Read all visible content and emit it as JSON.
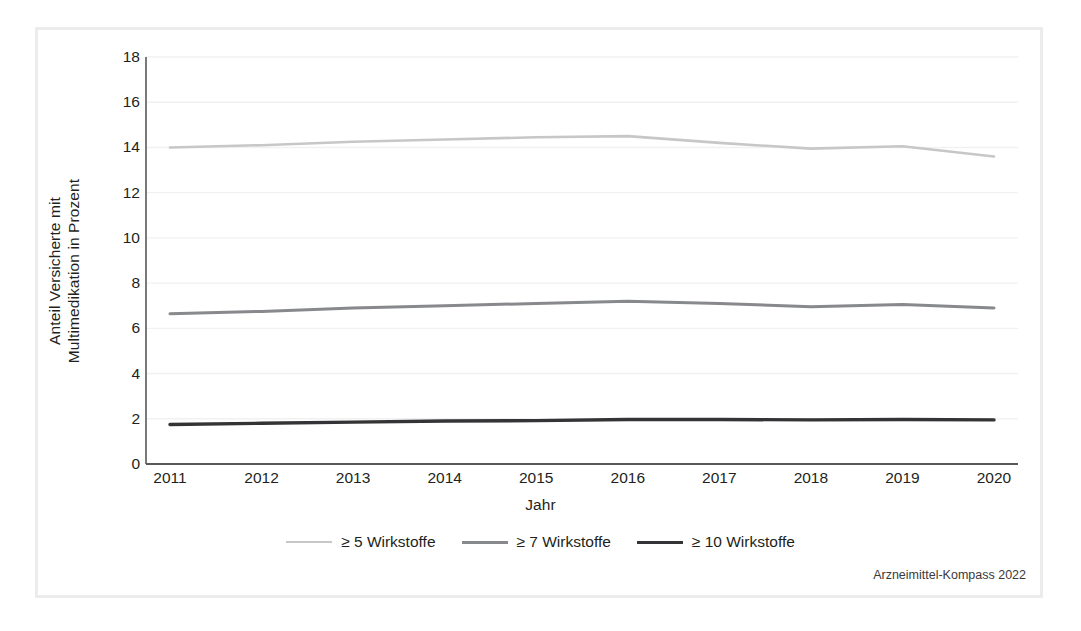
{
  "chart_data": {
    "type": "line",
    "title": "",
    "xlabel": "Jahr",
    "ylabel": "Anteil Versicherte mit Multimedikation in Prozent",
    "categories": [
      "2011",
      "2012",
      "2013",
      "2014",
      "2015",
      "2016",
      "2017",
      "2018",
      "2019",
      "2020"
    ],
    "x": [
      2011,
      2012,
      2013,
      2014,
      2015,
      2016,
      2017,
      2018,
      2019,
      2020
    ],
    "ylim": [
      0,
      18
    ],
    "yticks": [
      0,
      2,
      4,
      6,
      8,
      10,
      12,
      14,
      16,
      18
    ],
    "ytick_labels": [
      "0",
      "2",
      "4",
      "6",
      "8",
      "10",
      "12",
      "14",
      "16",
      "18"
    ],
    "grid": "horizontal",
    "legend_position": "bottom",
    "series": [
      {
        "name": "≥ 5 Wirkstoffe",
        "color": "#c7c7c9",
        "values": [
          14.0,
          14.1,
          14.25,
          14.35,
          14.45,
          14.5,
          14.2,
          13.95,
          14.05,
          13.6
        ]
      },
      {
        "name": "≥ 7 Wirkstoffe",
        "color": "#88898c",
        "values": [
          6.65,
          6.75,
          6.9,
          7.0,
          7.1,
          7.2,
          7.1,
          6.95,
          7.05,
          6.9
        ]
      },
      {
        "name": "≥ 10 Wirkstoffe",
        "color": "#343436",
        "values": [
          1.75,
          1.8,
          1.85,
          1.9,
          1.92,
          1.97,
          1.97,
          1.95,
          1.97,
          1.95
        ]
      }
    ],
    "source": "Arzneimittel-Kompass 2022"
  },
  "axes": {
    "y_title": "Anteil Versicherte mit Multimedikation in Prozent",
    "x_title": "Jahr"
  },
  "source_note": "Arzneimittel-Kompass 2022",
  "colors": {
    "frame": "#ececed",
    "grid": "#f1f1f2",
    "axis": "#58585b",
    "text": "#231f20"
  }
}
